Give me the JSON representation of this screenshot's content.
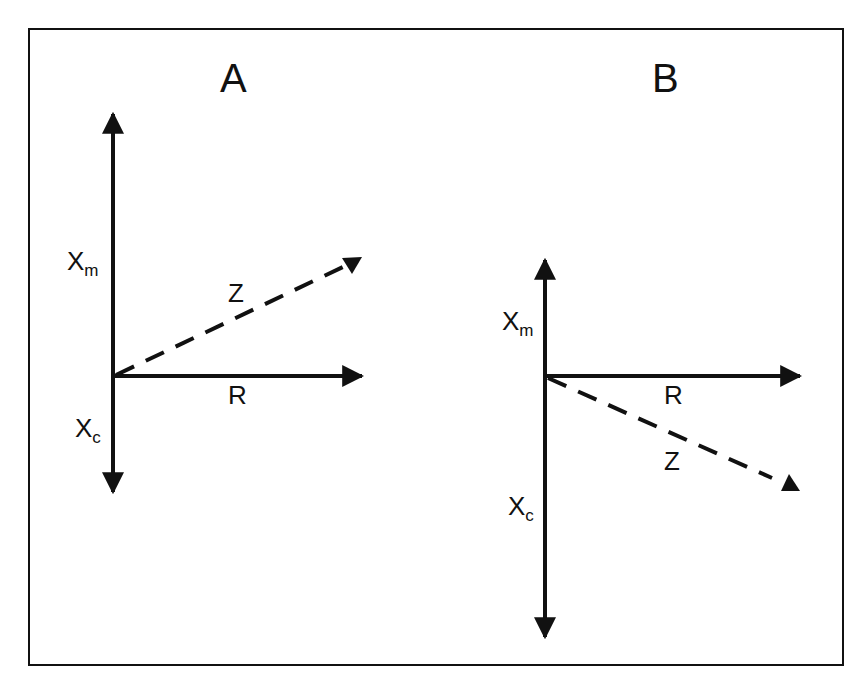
{
  "figure": {
    "panels": [
      {
        "id": "A",
        "title": "A",
        "axes": {
          "up_label": "X",
          "up_sub": "m",
          "down_label": "X",
          "down_sub": "c",
          "right_label": "R"
        },
        "vector_label": "Z",
        "vector_direction": "up-right (inductive)"
      },
      {
        "id": "B",
        "title": "B",
        "axes": {
          "up_label": "X",
          "up_sub": "m",
          "down_label": "X",
          "down_sub": "c",
          "right_label": "R"
        },
        "vector_label": "Z",
        "vector_direction": "down-right (capacitive)"
      }
    ],
    "colors": {
      "ink": "#111111",
      "background": "#ffffff"
    }
  }
}
